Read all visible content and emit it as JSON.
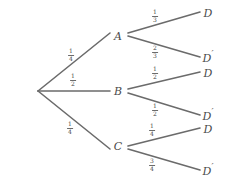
{
  "diagram": {
    "type": "tree",
    "line_color": "#6b6b6b",
    "text_color": "#4a4a4a",
    "background": "#ffffff",
    "root": {
      "label": "",
      "x": 38,
      "y": 91
    },
    "level1": [
      {
        "id": "A",
        "label": "A",
        "x": 118,
        "y": 36,
        "probability": "1/4",
        "numerator": "1",
        "denominator": "4",
        "edge_label_x": 71,
        "edge_label_y": 55
      },
      {
        "id": "B",
        "label": "B",
        "x": 118,
        "y": 91,
        "probability": "1/2",
        "numerator": "1",
        "denominator": "2",
        "edge_label_x": 73,
        "edge_label_y": 80
      },
      {
        "id": "C",
        "label": "C",
        "x": 118,
        "y": 146,
        "probability": "1/4",
        "numerator": "1",
        "denominator": "4",
        "edge_label_x": 70,
        "edge_label_y": 128
      }
    ],
    "level2": [
      {
        "id": "A-D",
        "parent": "A",
        "label": "D",
        "prime": false,
        "x": 208,
        "y": 13,
        "probability": "1/3",
        "numerator": "1",
        "denominator": "3",
        "edge_label_x": 155,
        "edge_label_y": 16
      },
      {
        "id": "A-Dprime",
        "parent": "A",
        "label": "D",
        "prime": true,
        "x": 208,
        "y": 57,
        "probability": "2/3",
        "numerator": "2",
        "denominator": "3",
        "edge_label_x": 155,
        "edge_label_y": 52
      },
      {
        "id": "B-D",
        "parent": "B",
        "label": "D",
        "prime": false,
        "x": 208,
        "y": 73,
        "probability": "1/2",
        "numerator": "1",
        "denominator": "2",
        "edge_label_x": 155,
        "edge_label_y": 73
      },
      {
        "id": "B-Dprime",
        "parent": "B",
        "label": "D",
        "prime": true,
        "x": 208,
        "y": 115,
        "probability": "1/2",
        "numerator": "1",
        "denominator": "2",
        "edge_label_x": 155,
        "edge_label_y": 110
      },
      {
        "id": "C-D",
        "parent": "C",
        "label": "D",
        "prime": false,
        "x": 208,
        "y": 129,
        "probability": "1/4",
        "numerator": "1",
        "denominator": "4",
        "edge_label_x": 152,
        "edge_label_y": 130
      },
      {
        "id": "C-Dprime",
        "parent": "C",
        "label": "D",
        "prime": true,
        "x": 208,
        "y": 170,
        "probability": "3/4",
        "numerator": "3",
        "denominator": "4",
        "edge_label_x": 152,
        "edge_label_y": 165
      }
    ]
  }
}
